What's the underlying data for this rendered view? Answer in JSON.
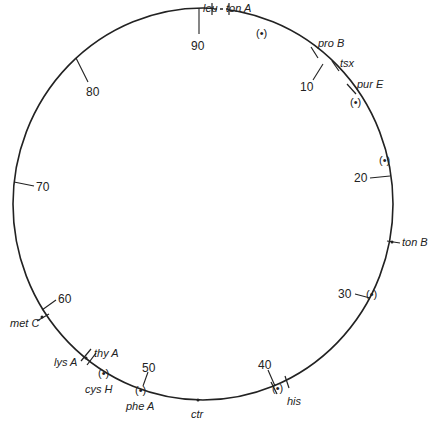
{
  "diagram": {
    "type": "circular genetic linkage map",
    "center": [
      203,
      204
    ],
    "radius": 193,
    "scale_max": 100,
    "zero_angle_deg": -92,
    "scale_ticks": [
      {
        "label": "90",
        "pos": 90
      },
      {
        "label": "80",
        "pos": 80
      },
      {
        "label": "70",
        "pos": 70
      },
      {
        "label": "60",
        "pos": 60
      },
      {
        "label": "50",
        "pos": 50
      },
      {
        "label": "40",
        "pos": 40
      },
      {
        "label": "30",
        "pos": 30
      },
      {
        "label": "20",
        "pos": 20
      },
      {
        "label": "10",
        "pos": 10
      }
    ],
    "genes": [
      {
        "label": "leu",
        "x": 212,
        "y": 6
      },
      {
        "label": "ton A",
        "x": 240,
        "y": 6
      },
      {
        "label": "pro B",
        "x": 318,
        "y": 46
      },
      {
        "label": "tsx",
        "x": 344,
        "y": 64
      },
      {
        "label": "pur E",
        "x": 356,
        "y": 87
      },
      {
        "label": "ton B",
        "x": 401,
        "y": 244
      },
      {
        "label": "his",
        "x": 287,
        "y": 403
      },
      {
        "label": "ctr",
        "x": 197,
        "y": 416
      },
      {
        "label": "phe A",
        "x": 139,
        "y": 410
      },
      {
        "label": "cys H",
        "x": 102,
        "y": 390
      },
      {
        "label": "lys A",
        "x": 58,
        "y": 362
      },
      {
        "label": "thy A",
        "x": 96,
        "y": 358
      },
      {
        "label": "met C",
        "x": 12,
        "y": 329
      }
    ],
    "origin_markers_label": "(•)",
    "origin_markers": [
      {
        "x": 268,
        "y": 33
      },
      {
        "x": 357,
        "y": 103
      },
      {
        "x": 386,
        "y": 188
      },
      {
        "x": 373,
        "y": 294
      },
      {
        "x": 280,
        "y": 385
      },
      {
        "x": 141,
        "y": 390
      },
      {
        "x": 104,
        "y": 373
      }
    ]
  }
}
